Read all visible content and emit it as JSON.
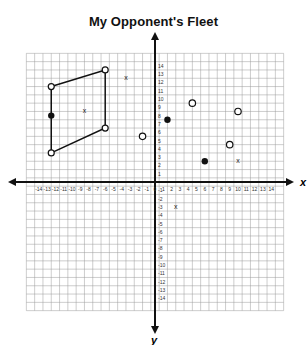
{
  "chart_data": {
    "type": "scatter",
    "title": "My Opponent's Fleet",
    "xlabel": "x",
    "ylabel": "y",
    "xlim": [
      -14,
      14
    ],
    "ylim": [
      -14,
      14
    ],
    "grid": true,
    "x_ticks": [
      -14,
      -13,
      -12,
      -11,
      -10,
      -9,
      -8,
      -7,
      -6,
      -5,
      -4,
      -3,
      -2,
      -1,
      0,
      1,
      2,
      3,
      4,
      5,
      6,
      7,
      8,
      9,
      10,
      11,
      12,
      13,
      14
    ],
    "y_ticks": [
      14,
      13,
      12,
      11,
      10,
      9,
      8,
      7,
      6,
      5,
      4,
      3,
      2,
      1,
      0,
      -1,
      -2,
      -3,
      -4,
      -5,
      -6,
      -7,
      -8,
      -9,
      -10,
      -11,
      -12,
      -13,
      -14
    ],
    "parallelogram": {
      "vertices": [
        {
          "x": -12.5,
          "y": 11.5
        },
        {
          "x": -6,
          "y": 13.5
        },
        {
          "x": -6,
          "y": 6.5
        },
        {
          "x": -12.5,
          "y": 3.5
        }
      ]
    },
    "hits": [
      {
        "x": -12.5,
        "y": 8
      },
      {
        "x": 1.5,
        "y": 7.5
      },
      {
        "x": 6,
        "y": 2.5
      }
    ],
    "misses": [
      {
        "x": -1.5,
        "y": 5.5
      },
      {
        "x": 4.5,
        "y": 9.5
      },
      {
        "x": 10,
        "y": 8.5
      },
      {
        "x": 9,
        "y": 4.5
      }
    ],
    "x_marks": [
      {
        "x": -3.5,
        "y": 12.5
      },
      {
        "x": -8.5,
        "y": 8.5
      },
      {
        "x": 10,
        "y": 2.5
      },
      {
        "x": 2.5,
        "y": -3
      }
    ]
  }
}
